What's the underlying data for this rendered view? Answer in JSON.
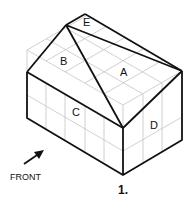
{
  "figure": {
    "number_label": "1.",
    "front_label": "FRONT",
    "face_labels": {
      "A": "A",
      "B": "B",
      "C": "C",
      "D": "D",
      "E": "E"
    },
    "colors": {
      "outline": "#111111",
      "grid": "#bbbbbb",
      "background": "#ffffff"
    }
  }
}
